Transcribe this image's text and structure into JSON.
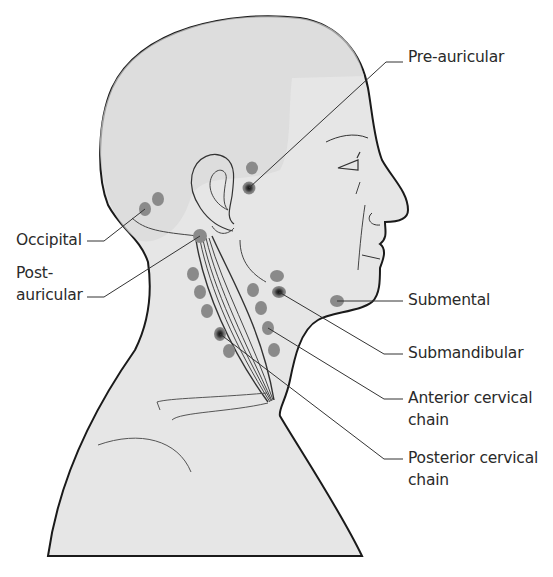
{
  "figure": {
    "colors": {
      "skin_fill": "#e6e6e6",
      "scalp_fill": "#dcdcdc",
      "outline": "#1a1a1a",
      "node_fill": "#8a8a8a",
      "node_center": "#1c1c1c",
      "leader_line": "#333333",
      "background": "#ffffff"
    },
    "labels": [
      {
        "id": "pre-auricular",
        "text": "Pre-auricular"
      },
      {
        "id": "occipital",
        "text": "Occipital"
      },
      {
        "id": "post-auricular",
        "line1": "Post-",
        "line2": "auricular"
      },
      {
        "id": "submental",
        "text": "Submental"
      },
      {
        "id": "submandibular",
        "text": "Submandibular"
      },
      {
        "id": "anterior-cervical-chain",
        "line1": "Anterior cervical",
        "line2": "chain"
      },
      {
        "id": "posterior-cervical-chain",
        "line1": "Posterior cervical",
        "line2": "chain"
      }
    ],
    "node_groups": [
      {
        "name": "Pre-auricular",
        "count": 2
      },
      {
        "name": "Occipital",
        "count": 2
      },
      {
        "name": "Post-auricular",
        "count": 1
      },
      {
        "name": "Posterior cervical chain",
        "count": 5
      },
      {
        "name": "Submandibular",
        "count": 2
      },
      {
        "name": "Anterior cervical chain",
        "count": 4
      },
      {
        "name": "Submental",
        "count": 1
      }
    ]
  }
}
